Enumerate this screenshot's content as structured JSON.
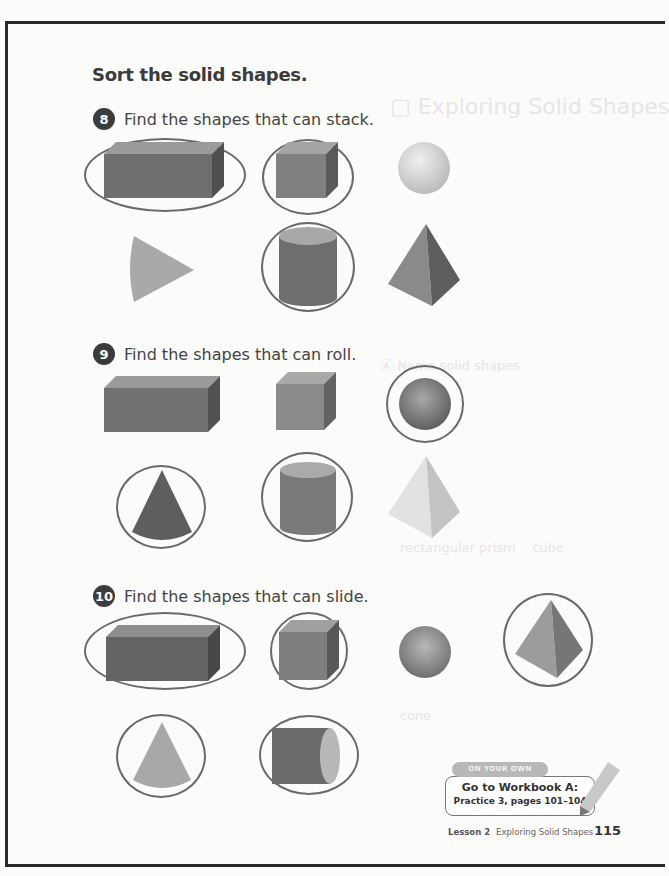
{
  "page": {
    "heading": "Sort the solid shapes.",
    "questions": [
      {
        "number": "8",
        "prompt": "Find the shapes that can stack.",
        "shapes": [
          {
            "name": "rectangular-prism",
            "circled": true
          },
          {
            "name": "cube",
            "circled": true
          },
          {
            "name": "sphere",
            "circled": false
          },
          {
            "name": "cone",
            "circled": false
          },
          {
            "name": "cylinder",
            "circled": true
          },
          {
            "name": "pyramid",
            "circled": false
          }
        ]
      },
      {
        "number": "9",
        "prompt": "Find the shapes that can roll.",
        "shapes": [
          {
            "name": "rectangular-prism",
            "circled": false
          },
          {
            "name": "cube",
            "circled": false
          },
          {
            "name": "sphere",
            "circled": true
          },
          {
            "name": "cone",
            "circled": true
          },
          {
            "name": "cylinder",
            "circled": true
          },
          {
            "name": "pyramid",
            "circled": false
          }
        ]
      },
      {
        "number": "10",
        "prompt": "Find the shapes that can slide.",
        "shapes": [
          {
            "name": "rectangular-prism",
            "circled": true
          },
          {
            "name": "cube",
            "circled": true
          },
          {
            "name": "sphere",
            "circled": false
          },
          {
            "name": "pyramid",
            "circled": true
          },
          {
            "name": "cone",
            "circled": true
          },
          {
            "name": "cylinder",
            "circled": true
          }
        ]
      }
    ],
    "on_your_own": {
      "tab": "ON YOUR OWN",
      "line1": "Go to Workbook A:",
      "line2": "Practice 3, pages 101–104"
    },
    "footer": {
      "lesson": "Lesson 2",
      "title": "Exploring Solid Shapes",
      "page_number": "115"
    }
  }
}
